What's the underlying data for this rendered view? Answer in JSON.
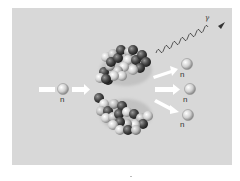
{
  "diagram": {
    "type": "nuclear-fission",
    "incoming_neutron": {
      "label": "n"
    },
    "fragments": [
      {
        "name": "upper-fission-fragment"
      },
      {
        "name": "lower-fission-fragment"
      }
    ],
    "emitted_neutrons": [
      {
        "label": "n"
      },
      {
        "label": "n"
      },
      {
        "label": "n"
      }
    ],
    "gamma_ray": {
      "label": "γ"
    },
    "colors": {
      "background": "#d8d8d8",
      "neutron": "#c8c8c8",
      "proton": "#4a4a4a",
      "arrow": "#ffffff",
      "wave": "#333333"
    }
  }
}
